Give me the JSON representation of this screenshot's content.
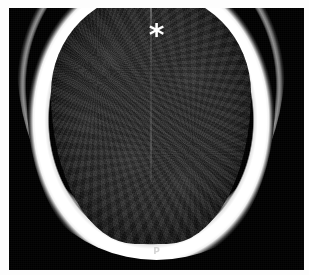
{
  "figure": {
    "modality": "CT",
    "plane": "axial",
    "region": "head",
    "frame_color": "#fdfdfd",
    "background_color": "#000000"
  },
  "annotations": {
    "asterisk": {
      "glyph": "*",
      "name": "asterisk-marker",
      "color": "#ffffff",
      "meaning": "extracranial hypodense collection"
    },
    "orientation": {
      "label": "P",
      "name": "posterior-orientation-marker",
      "color": "#c9c9c9"
    }
  },
  "anatomy": {
    "scalp": {
      "label": "scalp soft tissue",
      "density": "soft-tissue",
      "color": "#8e8e8e"
    },
    "collection": {
      "label": "subgaleal collection",
      "density": "hypodense",
      "color": "#0f0f0f"
    },
    "skull": {
      "label": "calvarium",
      "density": "bone",
      "color": "#ffffff"
    },
    "brain": {
      "label": "brain parenchyma",
      "density": "hypodense",
      "color": "#242424"
    },
    "midline": {
      "label": "interhemispheric fissure",
      "color": "#bebebe"
    }
  }
}
